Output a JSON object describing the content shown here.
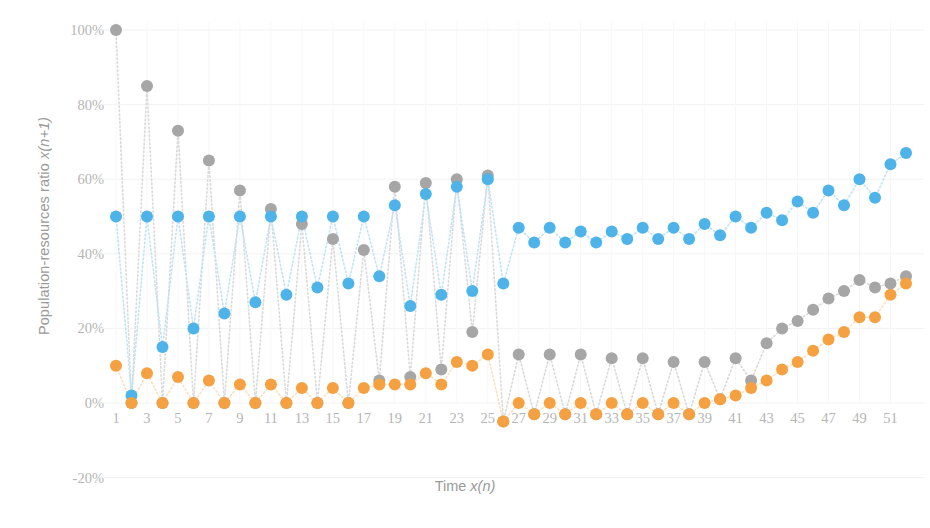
{
  "chart_data": {
    "type": "scatter",
    "title": "",
    "xlabel": "Time x(n)",
    "xlabel_plain": "Time ",
    "xlabel_italic": "x(n)",
    "ylabel": "Population-resources ratio x(n+1)",
    "ylabel_plain": "Population-resources ratio ",
    "ylabel_italic": "x(n+1)",
    "ylim": [
      -20,
      100
    ],
    "yticks": [
      "100%",
      "80%",
      "60%",
      "40%",
      "20%",
      "0%",
      "-20%"
    ],
    "ytick_values": [
      100,
      80,
      60,
      40,
      20,
      0,
      -20
    ],
    "xlim": [
      1,
      52
    ],
    "xticks": [
      "1",
      "3",
      "5",
      "7",
      "9",
      "11",
      "13",
      "15",
      "17",
      "19",
      "21",
      "23",
      "25",
      "27",
      "29",
      "31",
      "33",
      "35",
      "37",
      "39",
      "41",
      "43",
      "45",
      "47",
      "49",
      "51"
    ],
    "xtick_values": [
      1,
      3,
      5,
      7,
      9,
      11,
      13,
      15,
      17,
      19,
      21,
      23,
      25,
      27,
      29,
      31,
      33,
      35,
      37,
      39,
      41,
      43,
      45,
      47,
      49,
      51
    ],
    "grid": true,
    "grid_color": "#f2f2f2",
    "legend": "none",
    "marker_shape": "circle",
    "marker_radius": 6,
    "x": [
      1,
      2,
      3,
      4,
      5,
      6,
      7,
      8,
      9,
      10,
      11,
      12,
      13,
      14,
      15,
      16,
      17,
      18,
      19,
      20,
      21,
      22,
      23,
      24,
      25,
      26,
      27,
      28,
      29,
      30,
      31,
      32,
      33,
      34,
      35,
      36,
      37,
      38,
      39,
      40,
      41,
      42,
      43,
      44,
      45,
      46,
      47,
      48,
      49,
      50,
      51,
      52
    ],
    "series": [
      {
        "name": "gray-series",
        "color": "#a6a6a6",
        "line_color": "#d9d9d9",
        "values": [
          100,
          0,
          85,
          0,
          73,
          0,
          65,
          0,
          57,
          0,
          52,
          0,
          48,
          0,
          44,
          0,
          41,
          6,
          58,
          7,
          59,
          9,
          60,
          19,
          61,
          -5,
          13,
          -3,
          13,
          -3,
          13,
          -3,
          12,
          -3,
          12,
          -3,
          11,
          -3,
          11,
          1,
          12,
          6,
          16,
          20,
          22,
          25,
          28,
          30,
          33,
          31,
          32,
          34
        ]
      },
      {
        "name": "blue-series",
        "color": "#4eb3e8",
        "line_color": "#bfe3f7",
        "values": [
          50,
          2,
          50,
          15,
          50,
          20,
          50,
          24,
          50,
          27,
          50,
          29,
          50,
          31,
          50,
          32,
          50,
          34,
          53,
          26,
          56,
          29,
          58,
          30,
          60,
          32,
          47,
          43,
          47,
          43,
          46,
          43,
          46,
          44,
          47,
          44,
          47,
          44,
          48,
          45,
          50,
          47,
          51,
          49,
          54,
          51,
          57,
          53,
          60,
          55,
          64,
          67
        ]
      },
      {
        "name": "orange-series",
        "color": "#f5a142",
        "line_color": "#fbe0c0",
        "values": [
          10,
          0,
          8,
          0,
          7,
          0,
          6,
          0,
          5,
          0,
          5,
          0,
          4,
          0,
          4,
          0,
          4,
          5,
          5,
          5,
          8,
          5,
          11,
          10,
          13,
          -5,
          0,
          -3,
          0,
          -3,
          0,
          -3,
          0,
          -3,
          0,
          -3,
          0,
          -3,
          0,
          1,
          2,
          4,
          6,
          9,
          11,
          14,
          17,
          19,
          23,
          23,
          29,
          32
        ]
      }
    ]
  }
}
